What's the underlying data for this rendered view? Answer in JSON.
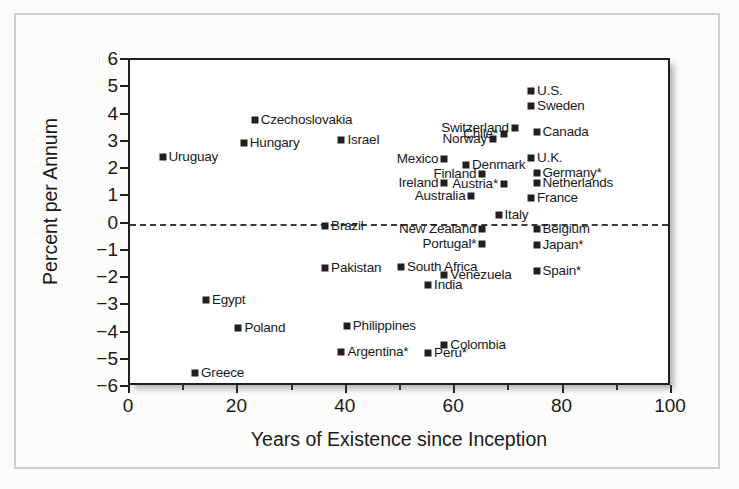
{
  "figure": {
    "background_color": "#fbfbfa",
    "frame_color": "#cfcfcf",
    "ink_color": "#231f20"
  },
  "chart_data": {
    "type": "scatter",
    "title": "",
    "xlabel": "Years of Existence since Inception",
    "ylabel": "Percent per Annum",
    "xlim": [
      0,
      100
    ],
    "ylim": [
      -6,
      6
    ],
    "xticks": [
      0,
      20,
      40,
      60,
      80,
      100
    ],
    "xtick_labels": [
      "0",
      "20",
      "40",
      "60",
      "80",
      "100"
    ],
    "xminor_ticks": [
      10,
      30,
      50,
      70,
      90
    ],
    "yticks": [
      6,
      5,
      4,
      3,
      2,
      1,
      0,
      -1,
      -2,
      -3,
      -4,
      -5,
      -6
    ],
    "ytick_labels": [
      "6",
      "5",
      "4",
      "3",
      "2",
      "1",
      "0",
      "−1",
      "−2",
      "−3",
      "−4",
      "−5",
      "−6"
    ],
    "grid": false,
    "reference_line": {
      "y": 0,
      "style": "dashed"
    },
    "legend": null,
    "note": "Asterisk (*) appended to a country name is part of the printed label.",
    "points": [
      {
        "label": "Uruguay",
        "x": 6,
        "y": 2.45,
        "label_side": "right"
      },
      {
        "label": "Czechoslovakia",
        "x": 23,
        "y": 3.8,
        "label_side": "right"
      },
      {
        "label": "Hungary",
        "x": 21,
        "y": 2.95,
        "label_side": "right"
      },
      {
        "label": "Israel",
        "x": 39,
        "y": 3.05,
        "label_side": "right"
      },
      {
        "label": "U.S.",
        "x": 74,
        "y": 4.85,
        "label_side": "right"
      },
      {
        "label": "Sweden",
        "x": 74,
        "y": 4.3,
        "label_side": "right"
      },
      {
        "label": "Switzerland",
        "x": 71,
        "y": 3.5,
        "label_side": "left"
      },
      {
        "label": "Canada",
        "x": 75,
        "y": 3.35,
        "label_side": "right"
      },
      {
        "label": "Chile*",
        "x": 69,
        "y": 3.3,
        "label_side": "left"
      },
      {
        "label": "Norway",
        "x": 67,
        "y": 3.1,
        "label_side": "left"
      },
      {
        "label": "Mexico",
        "x": 58,
        "y": 2.35,
        "label_side": "left"
      },
      {
        "label": "U.K.",
        "x": 74,
        "y": 2.4,
        "label_side": "right"
      },
      {
        "label": "Denmark",
        "x": 62,
        "y": 2.15,
        "label_side": "right"
      },
      {
        "label": "Finland",
        "x": 65,
        "y": 1.8,
        "label_side": "left"
      },
      {
        "label": "Germany*",
        "x": 75,
        "y": 1.85,
        "label_side": "right"
      },
      {
        "label": "Ireland",
        "x": 58,
        "y": 1.5,
        "label_side": "left"
      },
      {
        "label": "Netherlands",
        "x": 75,
        "y": 1.5,
        "label_side": "right"
      },
      {
        "label": "Austria*",
        "x": 69,
        "y": 1.45,
        "label_side": "left"
      },
      {
        "label": "Australia",
        "x": 63,
        "y": 1.0,
        "label_side": "left"
      },
      {
        "label": "France",
        "x": 74,
        "y": 0.95,
        "label_side": "right"
      },
      {
        "label": "Italy",
        "x": 68,
        "y": 0.3,
        "label_side": "right"
      },
      {
        "label": "Brazil",
        "x": 36,
        "y": -0.1,
        "label_side": "right"
      },
      {
        "label": "New Zealand",
        "x": 65,
        "y": -0.2,
        "label_side": "left"
      },
      {
        "label": "Belgium",
        "x": 75,
        "y": -0.2,
        "label_side": "right"
      },
      {
        "label": "Portugal*",
        "x": 65,
        "y": -0.75,
        "label_side": "left"
      },
      {
        "label": "Japan*",
        "x": 75,
        "y": -0.8,
        "label_side": "right"
      },
      {
        "label": "Pakistan",
        "x": 36,
        "y": -1.65,
        "label_side": "right"
      },
      {
        "label": "South Africa",
        "x": 50,
        "y": -1.6,
        "label_side": "right"
      },
      {
        "label": "Spain*",
        "x": 75,
        "y": -1.75,
        "label_side": "right"
      },
      {
        "label": "Venezuela",
        "x": 58,
        "y": -1.9,
        "label_side": "right"
      },
      {
        "label": "India",
        "x": 55,
        "y": -2.25,
        "label_side": "right"
      },
      {
        "label": "Egypt",
        "x": 14,
        "y": -2.8,
        "label_side": "right"
      },
      {
        "label": "Poland",
        "x": 20,
        "y": -3.85,
        "label_side": "right"
      },
      {
        "label": "Philippines",
        "x": 40,
        "y": -3.75,
        "label_side": "right"
      },
      {
        "label": "Colombia",
        "x": 58,
        "y": -4.45,
        "label_side": "right"
      },
      {
        "label": "Argentina*",
        "x": 39,
        "y": -4.7,
        "label_side": "right"
      },
      {
        "label": "Peru*",
        "x": 55,
        "y": -4.75,
        "label_side": "right"
      },
      {
        "label": "Greece",
        "x": 12,
        "y": -5.5,
        "label_side": "right"
      }
    ]
  }
}
